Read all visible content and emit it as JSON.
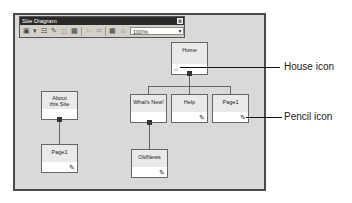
{
  "window": {
    "title": "Site Diagram",
    "close_glyph": "x",
    "zoom_value": "100%",
    "toolbar_icons": [
      "new-page-icon",
      "dropdown-arrow-icon",
      "add-child-icon",
      "add-existing-icon",
      "new-diagram-icon",
      "properties-icon",
      "cut-icon",
      "remove-link-icon",
      "expand-icon",
      "hierarchy-icon"
    ]
  },
  "nodes": [
    {
      "id": "home",
      "label": "Home",
      "icon": "house"
    },
    {
      "id": "about",
      "label": "About this Site",
      "icon": null
    },
    {
      "id": "whatsnew",
      "label": "What's New!",
      "icon": null
    },
    {
      "id": "help",
      "label": "Help",
      "icon": "pencil"
    },
    {
      "id": "page1",
      "label": "Page1",
      "icon": "pencil"
    },
    {
      "id": "about-page1",
      "label": "Page1",
      "icon": "pencil"
    },
    {
      "id": "oldnews",
      "label": "OldNews",
      "icon": "pencil"
    }
  ],
  "callouts": {
    "house": "House icon",
    "pencil": "Pencil icon"
  }
}
